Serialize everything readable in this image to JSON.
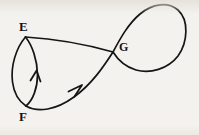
{
  "figure": {
    "background_color": "#f4f2ee",
    "ink_color": "#151515",
    "width": 199,
    "height": 135
  },
  "labels": {
    "e": "E",
    "f": "F",
    "g": "G"
  },
  "vertices": [
    {
      "id": "E",
      "label": "E",
      "x": 25,
      "y": 36
    },
    {
      "id": "F",
      "label": "F",
      "x": 26,
      "y": 106
    },
    {
      "id": "G",
      "label": "G",
      "x": 113,
      "y": 52
    }
  ],
  "edges": [
    {
      "name": "lens-left-arc",
      "from": "E",
      "to": "F",
      "description": "outer arc bulging left forming the left side of the bigon",
      "arrow": false
    },
    {
      "name": "lens-right-arc",
      "from": "F",
      "to": "E",
      "description": "inner arc bulging right forming the right side of the bigon",
      "arrow": true,
      "arrow_direction": "up",
      "arrow_at": {
        "x": 35,
        "y": 74
      }
    },
    {
      "name": "upper-edge-e-to-g",
      "from": "E",
      "to": "G",
      "description": "nearly straight curve bowing slightly upward",
      "arrow": false
    },
    {
      "name": "lower-edge-f-to-g",
      "from": "F",
      "to": "G",
      "description": "curve sagging downward then rising to the crossing point",
      "arrow": true,
      "arrow_direction": "up-right",
      "arrow_at": {
        "x": 76,
        "y": 90
      }
    },
    {
      "name": "right-loop",
      "from": "G",
      "to": "G",
      "description": "large teardrop loop extending to the right of the crossing point G",
      "arrow": false
    }
  ],
  "annotations": {
    "arrow_count": 2,
    "crossing_point": "G",
    "loop_extent": {
      "left": 113,
      "top": 4,
      "right": 186,
      "bottom": 70
    }
  }
}
